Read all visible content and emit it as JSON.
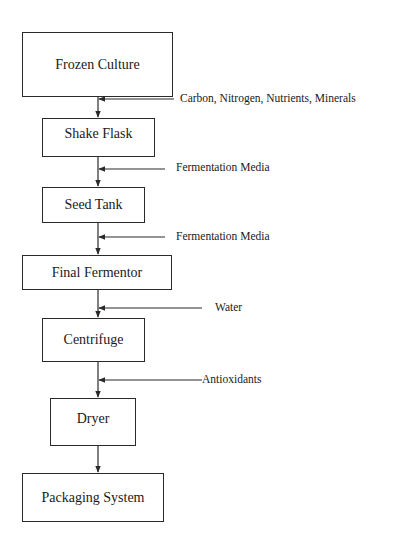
{
  "diagram": {
    "type": "process-flowchart",
    "line_color": "#2a2a2a",
    "steps": [
      {
        "id": "frozen-culture",
        "label": "Frozen Culture"
      },
      {
        "id": "shake-flask",
        "label": "Shake Flask"
      },
      {
        "id": "seed-tank",
        "label": "Seed Tank"
      },
      {
        "id": "final-fermentor",
        "label": "Final Fermentor"
      },
      {
        "id": "centrifuge",
        "label": "Centrifuge"
      },
      {
        "id": "dryer",
        "label": "Dryer"
      },
      {
        "id": "packaging-system",
        "label": "Packaging System"
      }
    ],
    "inputs": [
      {
        "between": "frozen-culture → shake-flask",
        "label": "Carbon, Nitrogen, Nutrients, Minerals"
      },
      {
        "between": "shake-flask → seed-tank",
        "label": "Fermentation Media"
      },
      {
        "between": "seed-tank → final-fermentor",
        "label": "Fermentation Media"
      },
      {
        "between": "final-fermentor → centrifuge",
        "label": "Water"
      },
      {
        "between": "centrifuge → dryer",
        "label": "Antioxidants"
      }
    ]
  }
}
